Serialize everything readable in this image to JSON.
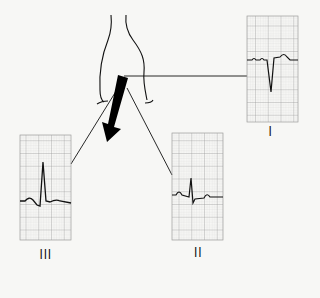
{
  "diagram": {
    "axis_arrow": "mean-electrical-axis",
    "leads": [
      {
        "id": "I",
        "label": "I",
        "box": [
          247,
          16,
          51,
          106
        ],
        "baseline_y": 60,
        "qrs": "negative"
      },
      {
        "id": "II",
        "label": "II",
        "box": [
          172,
          133,
          51,
          107
        ],
        "baseline_y": 198,
        "qrs": "small-positive"
      },
      {
        "id": "III",
        "label": "III",
        "box": [
          20,
          135,
          51,
          105
        ],
        "baseline_y": 204,
        "qrs": "tall-positive"
      }
    ],
    "colors": {
      "grid": "#b8b8b8",
      "trace": "#111111",
      "background": "#f7f7f5",
      "arrow": "#000000"
    }
  }
}
